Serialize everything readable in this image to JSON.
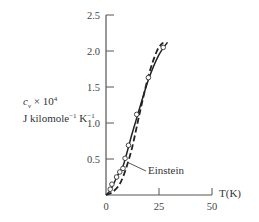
{
  "chart_data": {
    "type": "line",
    "title": "",
    "xlabel": "T(K)",
    "ylabel": "c_v × 10^4 J kilomole^-1 K^-1",
    "ylabel_lines": [
      "c",
      "v",
      "× 10",
      "4",
      "J kilomole",
      "-1",
      " K",
      "-1"
    ],
    "xlim": [
      0,
      50
    ],
    "ylim": [
      0,
      2.5
    ],
    "xticks": [
      0,
      25,
      50
    ],
    "xtick_labels": [
      "0",
      "25",
      "50"
    ],
    "yticks": [
      0.5,
      1.0,
      1.5,
      2.0,
      2.5
    ],
    "ytick_labels": [
      "0.5",
      "1.0",
      "1.5",
      "2.0",
      "2.5"
    ],
    "grid": false,
    "series": [
      {
        "name": "Experimental data",
        "style": "markers (open circles)",
        "x": [
          2,
          2.8,
          5,
          6.5,
          8,
          9,
          10.6,
          14.5,
          20,
          27
        ],
        "y": [
          0.08,
          0.15,
          0.25,
          0.32,
          0.37,
          0.51,
          0.69,
          1.12,
          1.63,
          2.05
        ]
      },
      {
        "name": "Debye (solid)",
        "style": "solid line",
        "x": [
          0,
          2,
          4,
          6,
          8,
          10,
          12,
          15,
          20,
          25,
          29
        ],
        "y": [
          0,
          0.06,
          0.18,
          0.3,
          0.4,
          0.6,
          0.82,
          1.12,
          1.6,
          1.95,
          2.12
        ]
      },
      {
        "name": "Einstein",
        "style": "dashed line",
        "x": [
          0,
          3,
          6,
          8,
          10,
          12,
          14,
          16,
          20,
          24,
          27
        ],
        "y": [
          0,
          0.04,
          0.13,
          0.25,
          0.42,
          0.62,
          0.88,
          1.15,
          1.65,
          2.0,
          2.12
        ]
      }
    ],
    "annotations": [
      {
        "text": "Einstein",
        "points_to": "dashed curve near T≈10 K, c_v≈0.45"
      }
    ]
  },
  "labels": {
    "einstein": "Einstein",
    "xaxis": "T(K)",
    "y_c": "c",
    "y_sub": "v",
    "y_times": " × 10",
    "y_exp4": "4",
    "y_units": "J kilomole",
    "y_exp_m1a": "−1",
    "y_K": " K",
    "y_exp_m1b": "−1"
  }
}
